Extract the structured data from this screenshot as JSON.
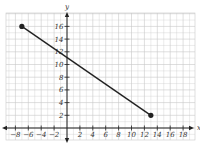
{
  "chart_data": {
    "type": "line",
    "title": "",
    "xlabel": "x",
    "ylabel": "y",
    "xlim": [
      -9.5,
      19.5
    ],
    "ylim": [
      -2,
      18
    ],
    "grid": true,
    "x_ticks": [
      -8,
      -6,
      -4,
      -2,
      2,
      4,
      6,
      8,
      10,
      12,
      14,
      16,
      18
    ],
    "y_ticks": [
      2,
      4,
      6,
      8,
      10,
      12,
      14,
      16
    ],
    "series": [
      {
        "name": "segment",
        "points": [
          [
            -7,
            16
          ],
          [
            13,
            2
          ]
        ],
        "endpoints_marked": true
      }
    ]
  },
  "colors": {
    "grid": "#c8c8c8",
    "axis": "#222222",
    "line": "#222222",
    "background": "#ffffff"
  }
}
